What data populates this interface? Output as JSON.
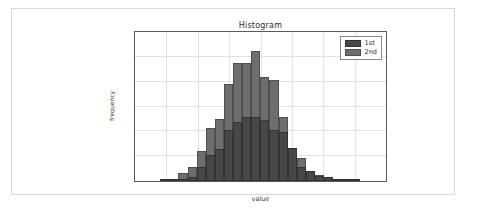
{
  "figure": {
    "background": "#ffffff",
    "frame_color": "#d8d8d8"
  },
  "chart_data": {
    "type": "bar",
    "subtype": "histogram-overlay",
    "title": "Histogram",
    "xlabel": "value",
    "ylabel": "frequency",
    "xlim": [
      -4,
      4
    ],
    "ylim": [
      0,
      300
    ],
    "xticks": [
      -4,
      -3,
      -2,
      -1,
      0,
      1,
      2,
      3,
      4
    ],
    "xticklabels": [
      "-4",
      "-3",
      "-2",
      "-1",
      "0",
      "1",
      "2",
      "3",
      "4"
    ],
    "yticks": [
      0,
      50,
      100,
      150,
      200,
      250,
      300
    ],
    "yticklabels": [
      "0",
      "50",
      "100",
      "150",
      "200",
      "250",
      "300"
    ],
    "grid": true,
    "legend_position": "upper right",
    "bin_width": 0.29,
    "bin_centers": [
      -3.34,
      -3.05,
      -2.76,
      -2.47,
      -2.18,
      -1.89,
      -1.6,
      -1.31,
      -1.02,
      -0.73,
      -0.44,
      -0.15,
      0.14,
      0.43,
      0.72,
      1.01,
      1.3,
      1.59,
      1.88,
      2.17,
      2.46,
      2.75,
      3.04,
      3.33
    ],
    "series": [
      {
        "name": "1st",
        "color": "#474747",
        "edgecolor": "#333333",
        "values": [
          0,
          2,
          1,
          4,
          9,
          28,
          52,
          64,
          103,
          119,
          128,
          128,
          122,
          103,
          99,
          66,
          29,
          20,
          11,
          8,
          3,
          2,
          1,
          0
        ]
      },
      {
        "name": "2nd",
        "color": "#6e6e6e",
        "edgecolor": "#4f4f4f",
        "values": [
          0,
          4,
          2,
          16,
          29,
          61,
          107,
          125,
          195,
          238,
          238,
          262,
          210,
          203,
          129,
          59,
          46,
          21,
          13,
          8,
          3,
          2,
          1,
          0
        ]
      }
    ]
  }
}
